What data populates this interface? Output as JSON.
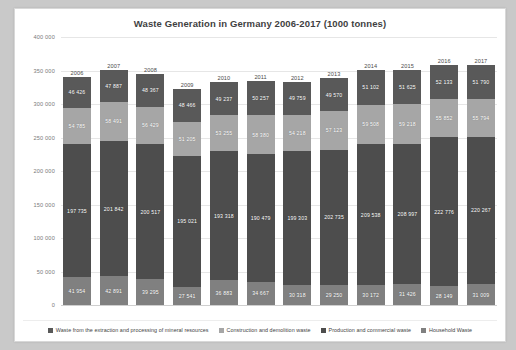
{
  "chart_data": {
    "type": "bar",
    "subtype": "stacked-bar",
    "title": "Waste Generation in Germany 2006-2017 (1000 tonnes)",
    "xlabel": "",
    "ylabel": "",
    "ylim": [
      0,
      400000
    ],
    "ytick_step": 50000,
    "grid": true,
    "legend_position": "bottom",
    "categories": [
      "2006",
      "2007",
      "2008",
      "2009",
      "2010",
      "2011",
      "2012",
      "2013",
      "2014",
      "2015",
      "2016",
      "2017"
    ],
    "ytick_labels": [
      "400 000",
      "350 000",
      "300 000",
      "250 000",
      "200 000",
      "150 000",
      "100 000",
      "50 000",
      "0"
    ],
    "ytick_values": [
      400000,
      350000,
      300000,
      250000,
      200000,
      150000,
      100000,
      50000,
      0
    ],
    "series": [
      {
        "name": "Waste from the extraction and processing of mineral resources",
        "color": "#595959",
        "values": [
          46426,
          47887,
          48367,
          48466,
          49237,
          50257,
          49759,
          49570,
          51102,
          51625,
          52133,
          51790
        ],
        "labels": [
          "46 426",
          "47 887",
          "48 367",
          "48 466",
          "49 237",
          "50 257",
          "49 759",
          "49 570",
          "51 102",
          "51 625",
          "52 133",
          "51 790"
        ]
      },
      {
        "name": "Construction and demolition waste",
        "color": "#a6a6a6",
        "values": [
          54785,
          58491,
          56429,
          51205,
          53255,
          58380,
          54218,
          57123,
          59508,
          59218,
          55852,
          55794
        ],
        "labels": [
          "54 785",
          "58 491",
          "56 429",
          "51 205",
          "53 255",
          "58 380",
          "54 218",
          "57 123",
          "59 508",
          "59 218",
          "55 852",
          "55 794"
        ]
      },
      {
        "name": "Production and commercial waste",
        "color": "#4d4d4d",
        "values": [
          197735,
          201842,
          200517,
          195021,
          193318,
          190479,
          199303,
          202735,
          209538,
          208997,
          222776,
          220267
        ],
        "labels": [
          "197 735",
          "201 842",
          "200 517",
          "195 021",
          "193 318",
          "190 479",
          "199 303",
          "202 735",
          "209 538",
          "208 997",
          "222 776",
          "220 267"
        ]
      },
      {
        "name": "Household Waste",
        "color": "#808080",
        "values": [
          41954,
          42891,
          39295,
          27541,
          36883,
          34667,
          30318,
          29250,
          30172,
          31426,
          28149,
          31009
        ],
        "labels": [
          "41 954",
          "42 891",
          "39 295",
          "27 541",
          "36 883",
          "34 667",
          "30 318",
          "29 250",
          "30 172",
          "31 426",
          "28 149",
          "31 009"
        ]
      }
    ]
  },
  "legend": {
    "items": [
      {
        "label": "Waste from the extraction and processing of mineral resources",
        "color": "#595959"
      },
      {
        "label": "Construction and demolition waste",
        "color": "#a6a6a6"
      },
      {
        "label": "Production and commercial waste",
        "color": "#4d4d4d"
      },
      {
        "label": "Household Waste",
        "color": "#808080"
      }
    ]
  }
}
